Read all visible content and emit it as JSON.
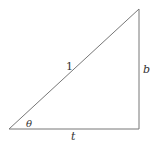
{
  "diagram": {
    "type": "right-triangle",
    "stroke_color": "#777777",
    "vertices": {
      "bottom_left": [
        9,
        129
      ],
      "bottom_right": [
        139,
        129
      ],
      "top_right": [
        139,
        9
      ]
    },
    "labels": {
      "hypotenuse": "1",
      "vertical_side": "b",
      "horizontal_side": "t",
      "angle": "θ"
    }
  }
}
